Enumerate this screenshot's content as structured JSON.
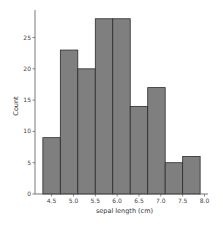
{
  "chart_data": {
    "type": "bar",
    "subtype": "histogram",
    "title": "",
    "xlabel": "sepal length (cm)",
    "ylabel": "Count",
    "bin_edges": [
      4.3,
      4.7,
      5.1,
      5.5,
      5.9,
      6.3,
      6.7,
      7.1,
      7.5,
      7.9
    ],
    "values": [
      9,
      23,
      20,
      28,
      28,
      14,
      17,
      5,
      6
    ],
    "xlim": [
      4.12,
      8.08
    ],
    "ylim": [
      0,
      29.4
    ],
    "xticks": [
      4.5,
      5.0,
      5.5,
      6.0,
      6.5,
      7.0,
      7.5,
      8.0
    ],
    "xtick_labels": [
      "4.5",
      "5.0",
      "5.5",
      "6.0",
      "6.5",
      "7.0",
      "7.5",
      "8.0"
    ],
    "yticks": [
      0,
      5,
      10,
      15,
      20,
      25
    ],
    "ytick_labels": [
      "0",
      "5",
      "10",
      "15",
      "20",
      "25"
    ],
    "grid": false,
    "legend": null,
    "bar_color": "#7f7f7f",
    "edge_color": "#2b2b2b",
    "spines": [
      "left",
      "bottom"
    ]
  }
}
